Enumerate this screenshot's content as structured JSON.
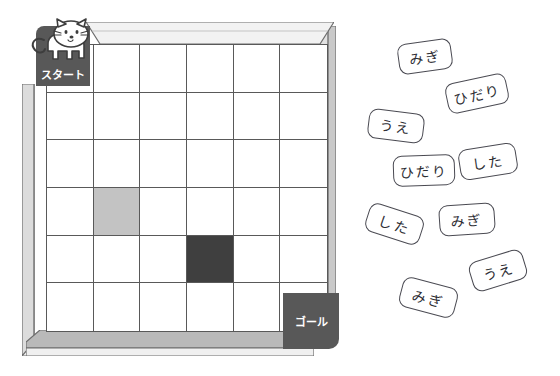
{
  "page": {
    "background_color": "#ffffff"
  },
  "board": {
    "name": "maze-board",
    "rows": 6,
    "columns": 6,
    "frame_color": "#d9d9d9",
    "frame_shade_color": "#a8a8a8",
    "grid_line_color": "#595959",
    "cell_color": "#ffffff",
    "start": {
      "label": "スタート",
      "row": 1,
      "column": 1,
      "color": "#585858",
      "text_color": "#ffffff"
    },
    "goal": {
      "label": "ゴール",
      "row": 6,
      "column": 6,
      "color": "#585858",
      "text_color": "#ffffff"
    },
    "marked_cells": [
      {
        "row": 4,
        "column": 2,
        "shade": "light",
        "color": "#c3c3c3"
      },
      {
        "row": 5,
        "column": 4,
        "shade": "dark",
        "color": "#3f3f3f"
      }
    ],
    "cells": [
      [
        {
          "row": 1,
          "column": 1,
          "shade": "none"
        },
        {
          "row": 1,
          "column": 2,
          "shade": "none"
        },
        {
          "row": 1,
          "column": 3,
          "shade": "none"
        },
        {
          "row": 1,
          "column": 4,
          "shade": "none"
        },
        {
          "row": 1,
          "column": 5,
          "shade": "none"
        },
        {
          "row": 1,
          "column": 6,
          "shade": "none"
        }
      ],
      [
        {
          "row": 2,
          "column": 1,
          "shade": "none"
        },
        {
          "row": 2,
          "column": 2,
          "shade": "none"
        },
        {
          "row": 2,
          "column": 3,
          "shade": "none"
        },
        {
          "row": 2,
          "column": 4,
          "shade": "none"
        },
        {
          "row": 2,
          "column": 5,
          "shade": "none"
        },
        {
          "row": 2,
          "column": 6,
          "shade": "none"
        }
      ],
      [
        {
          "row": 3,
          "column": 1,
          "shade": "none"
        },
        {
          "row": 3,
          "column": 2,
          "shade": "none"
        },
        {
          "row": 3,
          "column": 3,
          "shade": "none"
        },
        {
          "row": 3,
          "column": 4,
          "shade": "none"
        },
        {
          "row": 3,
          "column": 5,
          "shade": "none"
        },
        {
          "row": 3,
          "column": 6,
          "shade": "none"
        }
      ],
      [
        {
          "row": 4,
          "column": 1,
          "shade": "none"
        },
        {
          "row": 4,
          "column": 2,
          "shade": "light"
        },
        {
          "row": 4,
          "column": 3,
          "shade": "none"
        },
        {
          "row": 4,
          "column": 4,
          "shade": "none"
        },
        {
          "row": 4,
          "column": 5,
          "shade": "none"
        },
        {
          "row": 4,
          "column": 6,
          "shade": "none"
        }
      ],
      [
        {
          "row": 5,
          "column": 1,
          "shade": "none"
        },
        {
          "row": 5,
          "column": 2,
          "shade": "none"
        },
        {
          "row": 5,
          "column": 3,
          "shade": "none"
        },
        {
          "row": 5,
          "column": 4,
          "shade": "dark"
        },
        {
          "row": 5,
          "column": 5,
          "shade": "none"
        },
        {
          "row": 5,
          "column": 6,
          "shade": "none"
        }
      ],
      [
        {
          "row": 6,
          "column": 1,
          "shade": "none"
        },
        {
          "row": 6,
          "column": 2,
          "shade": "none"
        },
        {
          "row": 6,
          "column": 3,
          "shade": "none"
        },
        {
          "row": 6,
          "column": 4,
          "shade": "none"
        },
        {
          "row": 6,
          "column": 5,
          "shade": "none"
        },
        {
          "row": 6,
          "column": 6,
          "shade": "none"
        }
      ]
    ]
  },
  "character": {
    "name": "cat",
    "body_color": "#ffffff",
    "outline_color": "#3d3d3d",
    "position": "start-square"
  },
  "cards": [
    {
      "label": "みぎ",
      "meaning": "right",
      "x": 38,
      "y": 41,
      "w": 54,
      "h": 31,
      "rotate": -8
    },
    {
      "label": "ひだり",
      "meaning": "left",
      "x": 86,
      "y": 78,
      "w": 62,
      "h": 31,
      "rotate": -12
    },
    {
      "label": "うえ",
      "meaning": "up",
      "x": 8,
      "y": 111,
      "w": 56,
      "h": 30,
      "rotate": 7
    },
    {
      "label": "ひだり",
      "meaning": "left",
      "x": 33,
      "y": 155,
      "w": 62,
      "h": 31,
      "rotate": -2
    },
    {
      "label": "した",
      "meaning": "down",
      "x": 99,
      "y": 146,
      "w": 58,
      "h": 31,
      "rotate": -9
    },
    {
      "label": "した",
      "meaning": "down",
      "x": 6,
      "y": 209,
      "w": 57,
      "h": 30,
      "rotate": 18
    },
    {
      "label": "みぎ",
      "meaning": "right",
      "x": 79,
      "y": 204,
      "w": 56,
      "h": 31,
      "rotate": -4
    },
    {
      "label": "うえ",
      "meaning": "up",
      "x": 110,
      "y": 255,
      "w": 56,
      "h": 31,
      "rotate": -17
    },
    {
      "label": "みぎ",
      "meaning": "right",
      "x": 40,
      "y": 282,
      "w": 57,
      "h": 31,
      "rotate": 15
    }
  ]
}
